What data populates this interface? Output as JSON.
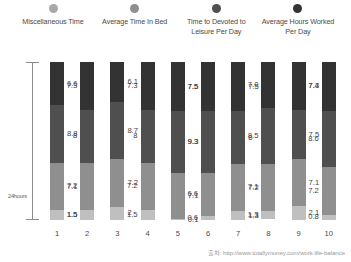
{
  "legend": {
    "items": [
      {
        "label": "Miscellaneous Time",
        "color": "#a8a8a8",
        "icon": "legend-dot-icon"
      },
      {
        "label": "Average Time In Bed",
        "color": "#8f8f8f",
        "icon": "legend-dot-icon"
      },
      {
        "label": "Time to Devoted to Leisure Per Day",
        "color": "#4f4f4f",
        "icon": "legend-dot-icon"
      },
      {
        "label": "Average Hours Worked Per Day",
        "color": "#333333",
        "icon": "legend-dot-icon"
      }
    ]
  },
  "axis": {
    "bracket_label": "24hours"
  },
  "source": {
    "text": "출처: http://www.totallymoney.com/work-life-balance"
  },
  "chart_data": {
    "type": "bar",
    "title": "",
    "subtitle": "",
    "xlabel": "",
    "ylabel": "24hours",
    "stacked": true,
    "grid": false,
    "legend_position": "top",
    "ylim": [
      0,
      24
    ],
    "categories": [
      "1",
      "2",
      "3",
      "4",
      "5",
      "6",
      "7",
      "8",
      "9",
      "10"
    ],
    "series": [
      {
        "name": "Average Hours Worked Per Day",
        "color": "#333333",
        "values": [
          6.6,
          7.3,
          6.1,
          7.3,
          7.5,
          7.5,
          7.5,
          7.0,
          7.3,
          7.4
        ]
      },
      {
        "name": "Time to Devoted to Leisure Per Day",
        "color": "#4f4f4f",
        "values": [
          8.8,
          8.0,
          8.7,
          8.0,
          9.3,
          9.3,
          8.0,
          8.5,
          7.5,
          8.6
        ]
      },
      {
        "name": "Average Time In Bed",
        "color": "#8f8f8f",
        "values": [
          7.1,
          7.2,
          7.2,
          7.2,
          7.1,
          6.6,
          7.2,
          7.1,
          7.1,
          7.2
        ]
      },
      {
        "name": "Miscellaneous Time",
        "color": "#bfbfbf",
        "values": [
          1.5,
          1.5,
          2.0,
          1.5,
          0.1,
          0.6,
          1.3,
          1.3,
          2.1,
          0.8
        ]
      }
    ],
    "value_labels": {
      "1": [
        "6.6",
        "8.8",
        "7.1",
        "1.5"
      ],
      "2": [
        "7.3",
        "8",
        "7.2",
        "1.5"
      ],
      "3": [
        "6.1",
        "8.7",
        "7.2",
        "2"
      ],
      "4": [
        "7.3",
        "8",
        "7.2",
        "1.5"
      ],
      "5": [
        "7.5",
        "9.3",
        "7.1",
        "0.1"
      ],
      "6": [
        "7.5",
        "9.3",
        "6.6",
        "0.6"
      ],
      "7": [
        "7.5",
        "8",
        "7.2",
        "1.3"
      ],
      "8": [
        "7.0",
        "8.5",
        "7.1",
        "1.3"
      ],
      "9": [
        "7.3",
        "7.5",
        "7.1",
        "2.1"
      ],
      "10": [
        "7.4",
        "8.6",
        "7.2",
        "0.8"
      ]
    }
  }
}
